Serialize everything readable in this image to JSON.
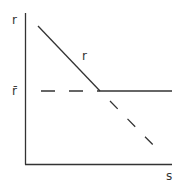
{
  "diagram": {
    "y_axis_label": "r",
    "x_axis_label": "s",
    "curve_label": "r",
    "level_label": "r̄",
    "colors": {
      "line": "#333333",
      "background": "#ffffff"
    }
  }
}
